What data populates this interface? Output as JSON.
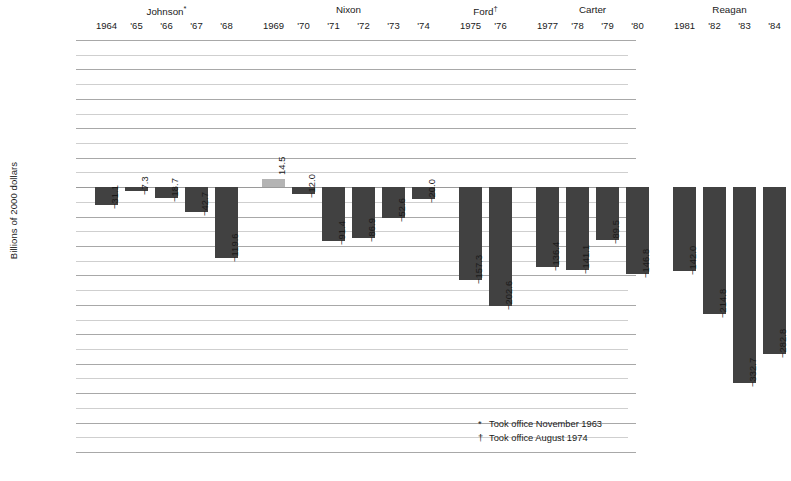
{
  "chart_data": {
    "type": "bar",
    "title": "",
    "subtitle": "",
    "xlabel": "",
    "ylabel": "Billions of 2000 dollars",
    "ylim": [
      -450,
      250
    ],
    "ytick_step": 50,
    "minor_gridline_step": 25,
    "grid": true,
    "legend": "none",
    "categories": [
      "1964",
      "'65",
      "'66",
      "'67",
      "'68",
      "1969",
      "'70",
      "'71",
      "'72",
      "'73",
      "'74",
      "1975",
      "'76",
      "1977",
      "'78",
      "'79",
      "'80",
      "1981",
      "'82",
      "'83",
      "'84"
    ],
    "values": [
      -31.1,
      -7.3,
      -18.7,
      -42.7,
      -119.6,
      14.5,
      -12.0,
      -91.4,
      -86.9,
      -52.6,
      -20.0,
      -157.3,
      -202.6,
      -136.4,
      -141.1,
      -89.5,
      -146.8,
      -142.0,
      -214.8,
      -332.7,
      -282.8
    ],
    "value_labels": [
      "-31.1",
      "-7.3",
      "-18.7",
      "-42.7",
      "-119.6",
      "14.5",
      "-12.0",
      "-91.4",
      "-86.9",
      "-52.6",
      "-20.0",
      "-157.3",
      "-202.6",
      "-136.4",
      "-141.1",
      "-89.5",
      "-146.8",
      "-142.0",
      "-214.8",
      "-332.7",
      "-282.8"
    ],
    "ytick_labels": [
      "250",
      "200",
      "150",
      "100",
      "50",
      "0",
      "-50",
      "-100",
      "-150",
      "-200",
      "-250",
      "-300",
      "-350",
      "-400",
      "-450"
    ],
    "ytick_values": [
      250,
      200,
      150,
      100,
      50,
      0,
      -50,
      -100,
      -150,
      -200,
      -250,
      -300,
      -350,
      -400,
      -450
    ],
    "groups": [
      {
        "name": "Johnson",
        "mark": "*",
        "indices": [
          0,
          1,
          2,
          3,
          4
        ]
      },
      {
        "name": "Nixon",
        "mark": "",
        "indices": [
          5,
          6,
          7,
          8,
          9,
          10
        ]
      },
      {
        "name": "Ford",
        "mark": "†",
        "indices": [
          11,
          12
        ]
      },
      {
        "name": "Carter",
        "mark": "",
        "indices": [
          13,
          14,
          15,
          16
        ]
      },
      {
        "name": "Reagan",
        "mark": "",
        "indices": [
          17,
          18,
          19,
          20
        ]
      }
    ],
    "colors": {
      "negative_bar": "#414141",
      "positive_bar": "#b4b4b4",
      "gridline": "#b9b9b9",
      "text": "#1a1a1a",
      "background": "#ffffff"
    },
    "annotations": [
      {
        "mark": "*",
        "text": "Took office November 1963"
      },
      {
        "mark": "†",
        "text": "Took office August 1974"
      }
    ]
  },
  "footnotes": [
    {
      "mark": "*",
      "text": "Took office November 1963"
    },
    {
      "mark": "†",
      "text": "Took office August 1974"
    }
  ]
}
